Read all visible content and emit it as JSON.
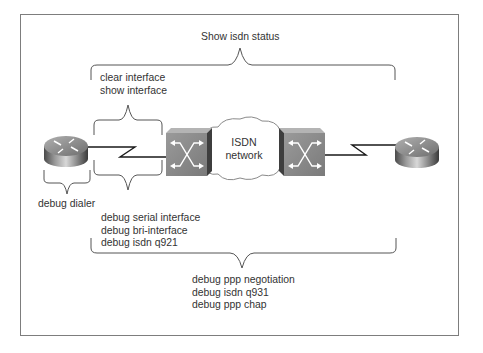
{
  "diagram": {
    "labels": {
      "top": "Show isdn status",
      "upper_interface": [
        "clear interface",
        "show interface"
      ],
      "dialer": "debug dialer",
      "lower_interface": [
        "debug serial interface",
        "debug bri-interface",
        "debug isdn q921"
      ],
      "bottom": [
        "debug ppp negotiation",
        "debug isdn q931",
        "debug ppp chap"
      ]
    },
    "cloud": {
      "line1": "ISDN",
      "line2": "network"
    },
    "nodes": [
      {
        "id": "router-left",
        "type": "router"
      },
      {
        "id": "switch-left",
        "type": "isdn-switch"
      },
      {
        "id": "cloud",
        "type": "isdn-network"
      },
      {
        "id": "switch-right",
        "type": "isdn-switch"
      },
      {
        "id": "router-right",
        "type": "router"
      }
    ],
    "links": [
      {
        "from": "router-left",
        "to": "switch-left",
        "type": "serial"
      },
      {
        "from": "switch-right",
        "to": "router-right",
        "type": "serial"
      }
    ],
    "colors": {
      "frame": "#7d7d7d",
      "line": "#1a1a1a",
      "brace": "#555555",
      "switch_face": "#8a8a8a",
      "switch_dark": "#3e3e3e",
      "router_body": "#777777"
    }
  }
}
